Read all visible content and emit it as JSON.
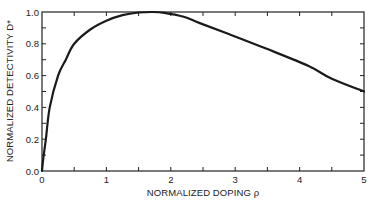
{
  "chart_data": {
    "type": "line",
    "title": "",
    "xlabel": "NORMALIZED DOPING ρ",
    "ylabel": "NORMALIZED DETECTIVITY D*",
    "xlim": [
      0,
      5
    ],
    "ylim": [
      0,
      1.0
    ],
    "x_ticks": [
      0,
      1,
      2,
      3,
      4,
      5
    ],
    "x_tick_labels": [
      "0",
      "1",
      "2",
      "3",
      "4",
      "5"
    ],
    "x_minor_ticks": [
      0.5,
      1.5,
      2.5,
      3.5,
      4.5
    ],
    "y_ticks": [
      0.0,
      0.2,
      0.4,
      0.6,
      0.8,
      1.0
    ],
    "y_tick_labels": [
      "0.0",
      "0.2",
      "0.4",
      "0.6",
      "0.8",
      "1.0"
    ],
    "y_minor_ticks": [
      0.1,
      0.3,
      0.5,
      0.7,
      0.9
    ],
    "grid": false,
    "legend": null,
    "series": [
      {
        "name": "D*",
        "color": "#1a1a1a",
        "x": [
          0,
          0.02,
          0.06,
          0.12,
          0.25,
          0.37,
          0.5,
          0.75,
          1.0,
          1.25,
          1.5,
          1.7,
          1.9,
          2.2,
          2.45,
          2.91,
          3.48,
          4.14,
          4.5,
          5.0
        ],
        "y": [
          0,
          0.08,
          0.2,
          0.4,
          0.6,
          0.7,
          0.8,
          0.89,
          0.945,
          0.98,
          0.997,
          1.0,
          0.995,
          0.97,
          0.93,
          0.86,
          0.77,
          0.66,
          0.58,
          0.5
        ]
      }
    ]
  }
}
